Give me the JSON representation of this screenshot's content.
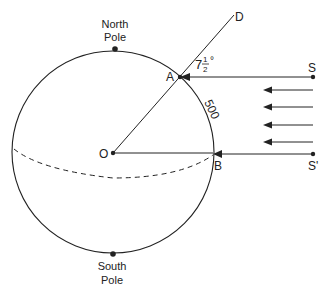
{
  "diagram": {
    "labels": {
      "north_pole_line1": "North",
      "north_pole_line2": "Pole",
      "south_pole_line1": "South",
      "south_pole_line2": "Pole",
      "point_a": "A",
      "point_b": "B",
      "point_o": "O",
      "point_d": "D",
      "point_s": "S",
      "point_s_prime": "S'",
      "angle_whole": "7",
      "angle_num": "1",
      "angle_den": "2",
      "angle_deg": "°",
      "arc_distance": "500"
    },
    "colors": {
      "stroke": "#222222",
      "background": "#ffffff"
    }
  }
}
